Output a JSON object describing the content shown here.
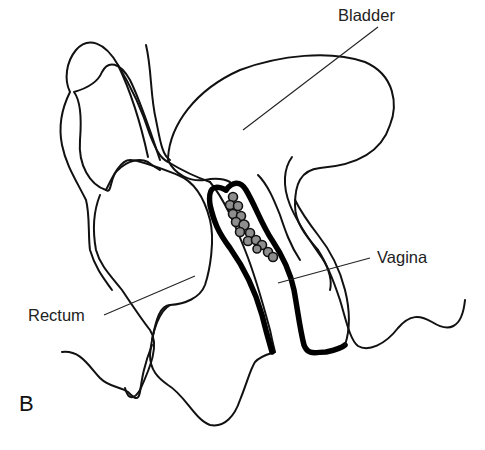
{
  "figure": {
    "panel_letter": "B",
    "labels": {
      "bladder": "Bladder",
      "vagina": "Vagina",
      "rectum": "Rectum"
    },
    "colors": {
      "line": "#111111",
      "nodule_fill": "#8e8e8e",
      "background": "#ffffff"
    }
  }
}
